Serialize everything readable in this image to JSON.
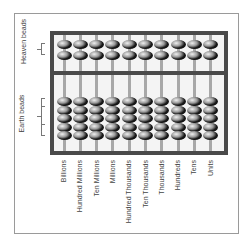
{
  "diagram": {
    "title": "",
    "side_labels": {
      "heaven": "Heaven beads",
      "earth": "Earth beads"
    },
    "rods": [
      {
        "label": "Billions"
      },
      {
        "label": "Hundred Millions"
      },
      {
        "label": "Ten Millions"
      },
      {
        "label": "Millions"
      },
      {
        "label": "Hundred Thousands"
      },
      {
        "label": "Ten Thousands"
      },
      {
        "label": "Thousands"
      },
      {
        "label": "Hundreds"
      },
      {
        "label": "Tens"
      },
      {
        "label": "Units"
      }
    ],
    "heaven_beads_per_rod": 2,
    "earth_beads_per_rod": 5,
    "colors": {
      "frame": "#4a4a4a",
      "rod": "#a8a8a8",
      "border": "#9a9a9a",
      "text": "#444444"
    }
  }
}
